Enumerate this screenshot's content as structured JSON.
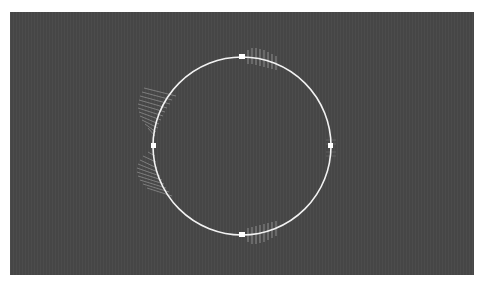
{
  "header": {
    "label": ""
  },
  "canvas": {
    "background": "#464646",
    "circle": {
      "cx": 232,
      "cy": 134,
      "r": 89,
      "stroke": "#f2f2f2"
    },
    "handles": [
      {
        "name": "top",
        "angle": -90
      },
      {
        "name": "right",
        "angle": 0
      },
      {
        "name": "bottom",
        "angle": 90
      },
      {
        "name": "left",
        "angle": 180
      }
    ]
  }
}
